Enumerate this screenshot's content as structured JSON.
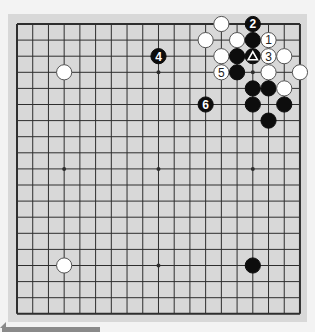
{
  "board": {
    "size": 19,
    "grid": {
      "left": 17,
      "top": 24,
      "dx": 15.72,
      "dy": 16.1
    },
    "colors": {
      "board": "#d8d8d8",
      "line": "#2e2e2e",
      "black": "#0d0d0d",
      "white": "#ffffff",
      "outer": "#f3f3f3"
    },
    "star_points": [
      [
        3,
        3
      ],
      [
        9,
        3
      ],
      [
        15,
        3
      ],
      [
        3,
        9
      ],
      [
        9,
        9
      ],
      [
        15,
        9
      ],
      [
        3,
        15
      ],
      [
        9,
        15
      ],
      [
        15,
        15
      ]
    ],
    "stones": [
      {
        "col": 3,
        "row": 3,
        "color": "white"
      },
      {
        "col": 3,
        "row": 15,
        "color": "white"
      },
      {
        "col": 15,
        "row": 15,
        "color": "black"
      },
      {
        "col": 13,
        "row": 0,
        "color": "white"
      },
      {
        "col": 15,
        "row": 0,
        "color": "black",
        "label": "2"
      },
      {
        "col": 12,
        "row": 1,
        "color": "white"
      },
      {
        "col": 14,
        "row": 1,
        "color": "white"
      },
      {
        "col": 15,
        "row": 1,
        "color": "black"
      },
      {
        "col": 16,
        "row": 1,
        "color": "white",
        "label": "1"
      },
      {
        "col": 13,
        "row": 2,
        "color": "white"
      },
      {
        "col": 14,
        "row": 2,
        "color": "black"
      },
      {
        "col": 15,
        "row": 2,
        "color": "black",
        "marker": "triangle"
      },
      {
        "col": 16,
        "row": 2,
        "color": "white",
        "label": "3"
      },
      {
        "col": 17,
        "row": 2,
        "color": "white"
      },
      {
        "col": 13,
        "row": 3,
        "color": "white",
        "label": "5"
      },
      {
        "col": 14,
        "row": 3,
        "color": "black"
      },
      {
        "col": 16,
        "row": 3,
        "color": "white"
      },
      {
        "col": 18,
        "row": 3,
        "color": "white"
      },
      {
        "col": 9,
        "row": 2,
        "color": "black",
        "label": "4"
      },
      {
        "col": 12,
        "row": 5,
        "color": "black",
        "label": "6"
      },
      {
        "col": 15,
        "row": 4,
        "color": "black"
      },
      {
        "col": 16,
        "row": 4,
        "color": "black"
      },
      {
        "col": 17,
        "row": 4,
        "color": "white"
      },
      {
        "col": 15,
        "row": 5,
        "color": "black"
      },
      {
        "col": 17,
        "row": 5,
        "color": "black"
      },
      {
        "col": 16,
        "row": 6,
        "color": "black"
      }
    ]
  }
}
